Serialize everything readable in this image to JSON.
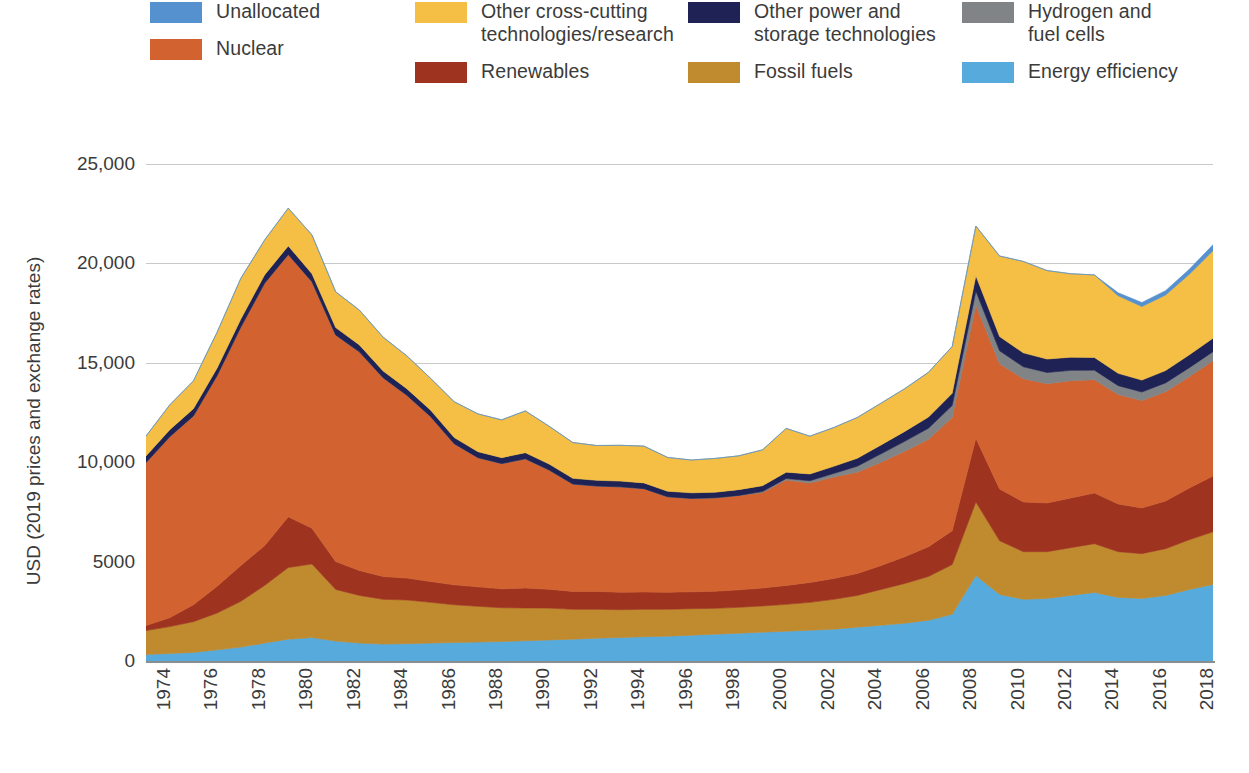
{
  "legend": {
    "columns": [
      [
        {
          "label": "Unallocated",
          "color": "#5590CF",
          "key": "unallocated"
        },
        {
          "label": "Nuclear",
          "color": "#D2622F",
          "key": "nuclear"
        }
      ],
      [
        {
          "label": "Other cross-cutting\ntechnologies/research",
          "color": "#F4BF44",
          "key": "other_cross_cutting"
        },
        {
          "label": "Renewables",
          "color": "#9E3420",
          "key": "renewables"
        }
      ],
      [
        {
          "label": "Other power and\nstorage technologies",
          "color": "#1E2254",
          "key": "other_power_storage"
        },
        {
          "label": "Fossil fuels",
          "color": "#C08A2E",
          "key": "fossil_fuels"
        }
      ],
      [
        {
          "label": "Hydrogen and\nfuel cells",
          "color": "#808487",
          "key": "hydrogen_fuel_cells"
        },
        {
          "label": "Energy efficiency",
          "color": "#56AADC",
          "key": "energy_efficiency"
        }
      ]
    ]
  },
  "axes": {
    "y_title": "USD (2019 prices and exchange rates)",
    "y_ticks": [
      "25,000",
      "20,000",
      "15,000",
      "10,000",
      "5000",
      "0"
    ],
    "y_tick_values": [
      25000,
      20000,
      15000,
      10000,
      5000,
      0
    ],
    "x_ticks": [
      "1974",
      "1976",
      "1978",
      "1980",
      "1982",
      "1984",
      "1986",
      "1988",
      "1990",
      "1992",
      "1994",
      "1996",
      "1998",
      "2000",
      "2002",
      "2004",
      "2006",
      "2008",
      "2010",
      "2012",
      "2014",
      "2016",
      "2018"
    ]
  },
  "chart_data": {
    "type": "area",
    "stacked": true,
    "title": "",
    "xlabel": "",
    "ylabel": "USD (2019 prices and exchange rates)",
    "ylim": [
      0,
      25000
    ],
    "xlim": [
      1974,
      2019
    ],
    "grid": true,
    "legend_position": "top",
    "x": [
      1974,
      1975,
      1976,
      1977,
      1978,
      1979,
      1980,
      1981,
      1982,
      1983,
      1984,
      1985,
      1986,
      1987,
      1988,
      1989,
      1990,
      1991,
      1992,
      1993,
      1994,
      1995,
      1996,
      1997,
      1998,
      1999,
      2000,
      2001,
      2002,
      2003,
      2004,
      2005,
      2006,
      2007,
      2008,
      2009,
      2010,
      2011,
      2012,
      2013,
      2014,
      2015,
      2016,
      2017,
      2018,
      2019
    ],
    "stack_order_bottom_to_top": [
      "energy_efficiency",
      "fossil_fuels",
      "renewables",
      "nuclear",
      "hydrogen_fuel_cells",
      "other_power_storage",
      "other_cross_cutting",
      "unallocated"
    ],
    "series": [
      {
        "name": "Energy efficiency",
        "color": "#56AADC",
        "values": [
          330,
          380,
          430,
          560,
          700,
          900,
          1100,
          1180,
          1000,
          900,
          850,
          870,
          900,
          930,
          950,
          980,
          1020,
          1060,
          1100,
          1150,
          1180,
          1220,
          1250,
          1300,
          1350,
          1400,
          1450,
          1500,
          1550,
          1600,
          1700,
          1800,
          1900,
          2050,
          2350,
          4300,
          3350,
          3100,
          3150,
          3300,
          3450,
          3200,
          3150,
          3300,
          3600,
          3850
        ]
      },
      {
        "name": "Fossil fuels",
        "color": "#C08A2E",
        "values": [
          1200,
          1350,
          1550,
          1850,
          2300,
          2900,
          3600,
          3700,
          2600,
          2400,
          2250,
          2200,
          2050,
          1900,
          1800,
          1700,
          1650,
          1600,
          1500,
          1450,
          1400,
          1380,
          1350,
          1330,
          1300,
          1300,
          1320,
          1350,
          1400,
          1500,
          1600,
          1800,
          2000,
          2200,
          2500,
          3700,
          2700,
          2400,
          2350,
          2400,
          2450,
          2300,
          2250,
          2350,
          2500,
          2650
        ]
      },
      {
        "name": "Renewables",
        "color": "#9E3420",
        "values": [
          250,
          450,
          850,
          1350,
          1800,
          2000,
          2550,
          1800,
          1400,
          1250,
          1150,
          1100,
          1050,
          1000,
          980,
          950,
          1000,
          950,
          900,
          900,
          880,
          870,
          860,
          850,
          860,
          880,
          900,
          950,
          1000,
          1050,
          1100,
          1200,
          1350,
          1500,
          1700,
          3200,
          2600,
          2500,
          2450,
          2500,
          2550,
          2400,
          2300,
          2400,
          2600,
          2800
        ]
      },
      {
        "name": "Nuclear",
        "color": "#D2622F",
        "values": [
          8200,
          9100,
          9500,
          10600,
          12000,
          13200,
          13200,
          12400,
          11400,
          11000,
          10000,
          9200,
          8300,
          7100,
          6500,
          6300,
          6500,
          6000,
          5400,
          5300,
          5300,
          5200,
          4800,
          4700,
          4700,
          4750,
          4800,
          5300,
          5000,
          5100,
          5100,
          5200,
          5300,
          5400,
          5700,
          6700,
          6300,
          6200,
          6000,
          5900,
          5700,
          5500,
          5400,
          5500,
          5600,
          5800
        ]
      },
      {
        "name": "Hydrogen and fuel cells",
        "color": "#808487",
        "values": [
          0,
          0,
          0,
          0,
          0,
          0,
          0,
          0,
          0,
          0,
          0,
          0,
          0,
          0,
          0,
          0,
          0,
          0,
          0,
          0,
          0,
          0,
          0,
          0,
          0,
          0,
          50,
          80,
          120,
          180,
          300,
          420,
          500,
          560,
          600,
          700,
          650,
          600,
          560,
          520,
          480,
          450,
          430,
          440,
          450,
          460
        ]
      },
      {
        "name": "Other power and storage technologies",
        "color": "#1E2254",
        "values": [
          330,
          350,
          360,
          380,
          400,
          420,
          430,
          400,
          370,
          350,
          340,
          330,
          320,
          310,
          300,
          300,
          310,
          300,
          290,
          290,
          290,
          290,
          280,
          280,
          280,
          290,
          300,
          320,
          340,
          360,
          400,
          450,
          500,
          560,
          620,
          780,
          720,
          700,
          680,
          660,
          640,
          620,
          600,
          620,
          650,
          680
        ]
      },
      {
        "name": "Other cross-cutting technologies/research",
        "color": "#F4BF44",
        "values": [
          1000,
          1250,
          1400,
          1800,
          2050,
          1750,
          1900,
          1950,
          1800,
          1750,
          1700,
          1650,
          1600,
          1800,
          1900,
          1900,
          2100,
          1900,
          1800,
          1750,
          1800,
          1850,
          1700,
          1650,
          1700,
          1700,
          1800,
          2200,
          1900,
          1950,
          2050,
          2100,
          2150,
          2250,
          2350,
          2500,
          4050,
          4600,
          4450,
          4200,
          4150,
          3900,
          3700,
          3800,
          4050,
          4400
        ]
      },
      {
        "name": "Unallocated",
        "color": "#5590CF",
        "values": [
          0,
          0,
          0,
          0,
          0,
          0,
          0,
          0,
          0,
          0,
          0,
          0,
          0,
          0,
          0,
          0,
          0,
          0,
          0,
          0,
          0,
          0,
          0,
          0,
          0,
          0,
          0,
          0,
          0,
          0,
          0,
          0,
          0,
          0,
          0,
          0,
          0,
          0,
          0,
          0,
          0,
          150,
          200,
          220,
          250,
          300
        ]
      }
    ],
    "totals": [
      11310,
      12880,
      14090,
      16540,
      19250,
      21170,
      22780,
      21430,
      18570,
      17750,
      16290,
      15350,
      14220,
      13040,
      12430,
      12130,
      12580,
      11810,
      10990,
      10840,
      10850,
      10810,
      10240,
      10110,
      10190,
      10320,
      10620,
      11700,
      11310,
      11740,
      12250,
      12970,
      13700,
      14520,
      15820,
      21880,
      20370,
      20100,
      19640,
      19480,
      19420,
      18520,
      18030,
      18430,
      19700,
      20940
    ]
  }
}
